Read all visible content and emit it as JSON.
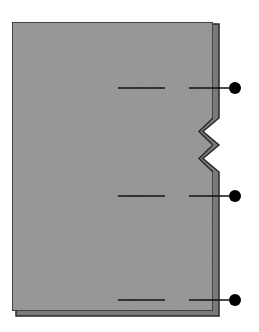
{
  "diagram": {
    "colors": {
      "background": "#ffffff",
      "page_fill": "#9a9a9a",
      "back_page_fill": "#7a7a7a",
      "edge_stroke": "#2a2a2a",
      "leader_line": "#111111",
      "dot": "#000000"
    },
    "front_page": {
      "x": 12,
      "y": 22,
      "right": 213,
      "bottom": 311
    },
    "back_page": {
      "right": 219,
      "bottom": 316
    },
    "zigzag": {
      "top": 118,
      "bottom": 172,
      "inner_x": 199
    },
    "markers": [
      {
        "name": "marker-top",
        "y": 88,
        "seg1": [
          118,
          165
        ],
        "seg2": [
          189,
          229
        ],
        "dot_x": 235
      },
      {
        "name": "marker-middle",
        "y": 196,
        "seg1": [
          118,
          165
        ],
        "seg2": [
          189,
          229
        ],
        "dot_x": 235
      },
      {
        "name": "marker-bottom",
        "y": 300,
        "seg1": [
          118,
          165
        ],
        "seg2": [
          189,
          229
        ],
        "dot_x": 235
      }
    ]
  }
}
